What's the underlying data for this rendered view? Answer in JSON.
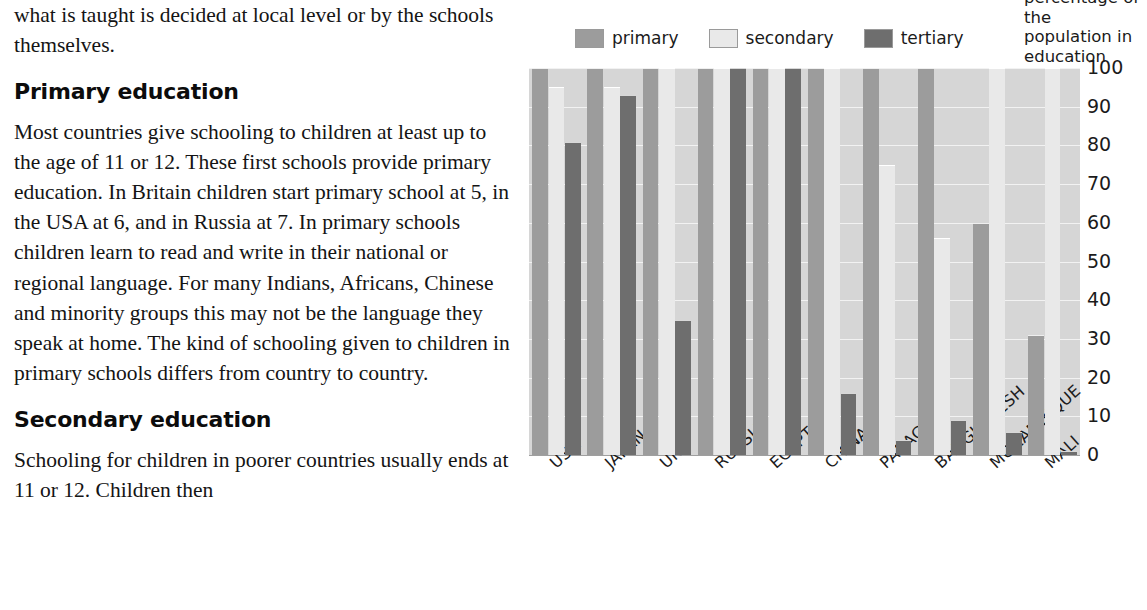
{
  "article": {
    "intro_paragraph": "what is taught is decided at local level or by the schools themselves.",
    "heading_primary": "Primary education",
    "paragraph_primary": "Most countries give schooling to children at least up to the age of 11 or 12. These first schools provide primary education. In Britain children start primary school at 5, in the USA at 6, and in Russia at 7. In primary schools children learn to read and write in their national or regional language. For many Indians, Africans, Chinese and minority groups this may not be the language they speak at home. The kind of schooling given to children in primary schools differs from country to country.",
    "heading_secondary": "Secondary education",
    "paragraph_secondary": "Schooling for children in poorer countries usually ends at 11 or 12. Children then"
  },
  "chart_caption": "percentage of the population in education",
  "legend": {
    "items": [
      {
        "label": "primary",
        "color": "#9c9c9c"
      },
      {
        "label": "secondary",
        "color": "#e9e9e9"
      },
      {
        "label": "tertiary",
        "color": "#6e6e6e"
      }
    ]
  },
  "chart_data": {
    "type": "bar",
    "title": "",
    "xlabel": "",
    "ylabel": "percentage of the population in education",
    "ylim": [
      0,
      100
    ],
    "yticks": [
      0,
      10,
      20,
      30,
      40,
      50,
      60,
      70,
      80,
      90,
      100
    ],
    "grid": true,
    "legend_position": "top",
    "categories": [
      "USA",
      "JAPAN",
      "UK",
      "RUSSIA",
      "EGYPT",
      "CHINA",
      "PARAGUAY",
      "BANGLADESH",
      "MOZAMBIQUE",
      "MALI"
    ],
    "series": [
      {
        "name": "primary",
        "color": "#9c9c9c",
        "values": [
          100,
          100,
          100,
          100,
          100,
          100,
          100,
          100,
          60,
          31
        ]
      },
      {
        "name": "secondary",
        "color": "#e9e9e9",
        "values": [
          95,
          95,
          100,
          100,
          100,
          100,
          75,
          56,
          100,
          100
        ]
      },
      {
        "name": "tertiary",
        "color": "#6e6e6e",
        "values": [
          81,
          93,
          35,
          100,
          100,
          16,
          4,
          9,
          6,
          1
        ]
      }
    ]
  },
  "plot": {
    "background_color": "#d6d6d6",
    "gridline_color": "#f2f2f2"
  }
}
